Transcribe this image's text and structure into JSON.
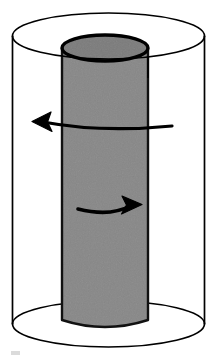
{
  "figure": {
    "title": "Coaxial cylinders with opposing circumferential flow arrows",
    "background_color": "#ffffff",
    "stroke_color": "#000000",
    "inner_cylinder_fill": "#878787",
    "inner_cylinder_top_fill": "#7b7b7b"
  },
  "shapes": {
    "outer_cylinder": {
      "name": "outer-cylinder",
      "label": "Outer transparent cylinder",
      "center_x": 108.5,
      "top_ellipse": {
        "cy": 36,
        "rx": 96,
        "ry": 23
      },
      "bottom_ellipse": {
        "cy": 324,
        "rx": 96,
        "ry": 23
      },
      "left_wall_x": 12.5,
      "right_wall_x": 204.5,
      "stroke_width": 1.6,
      "fill": "none"
    },
    "inner_cylinder": {
      "name": "inner-cylinder",
      "label": "Inner solid gray cylinder",
      "center_x": 105,
      "top_ellipse": {
        "cy": 48,
        "rx": 43,
        "ry": 13
      },
      "bottom_ellipse": {
        "cy": 320,
        "rx": 43,
        "ry": 12
      },
      "left_wall_x": 62,
      "right_wall_x": 148,
      "body_top_y": 48,
      "body_bottom_y": 320,
      "stroke_width": 2.6,
      "top_face_stroke_width": 3.4
    },
    "seam_line": {
      "name": "inner-cylinder-seam",
      "x": 148,
      "y_start": 56,
      "y_end": 78,
      "stroke_width": 1.6
    }
  },
  "arrows": {
    "upper": {
      "name": "flow-arrow-left",
      "direction": "left",
      "label": "Counter-clockwise circumferential flow (upper)",
      "tail_x": 172,
      "tail_y": 126,
      "tip_x": 33,
      "tip_y": 122,
      "control_x": 102,
      "control_y": 133,
      "stroke_width": 3.2,
      "head_length": 18,
      "head_width": 15
    },
    "lower": {
      "name": "flow-arrow-right",
      "direction": "right",
      "label": "Clockwise circumferential flow (lower)",
      "tail_x": 78,
      "tail_y": 209,
      "tip_x": 141,
      "tip_y": 205,
      "control_x": 110,
      "control_y": 216,
      "stroke_width": 3.6,
      "head_length": 19,
      "head_width": 16
    }
  },
  "artifacts": {
    "scan_smudge": {
      "name": "scan-smudge",
      "visible": true,
      "x": 11,
      "y": 351
    }
  }
}
